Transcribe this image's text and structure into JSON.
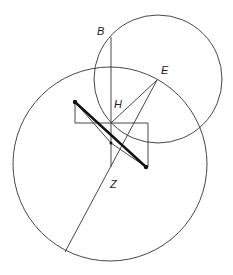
{
  "diagram": {
    "labels": {
      "B": "B",
      "E": "E",
      "H": "H",
      "Z": "Z"
    },
    "colors": {
      "line": "#333333",
      "thick_line": "#111111",
      "background": "#ffffff"
    },
    "shapes": {
      "large_circle": {
        "cx": 110,
        "cy": 164,
        "r": 97
      },
      "small_circle": {
        "cx": 158,
        "cy": 79,
        "r": 64
      }
    }
  }
}
